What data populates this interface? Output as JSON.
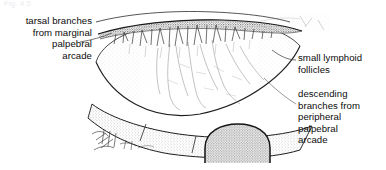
{
  "figure": {
    "title_partial": "Fig. 4.5",
    "background_color": "#ffffff",
    "ink_color": "#1a1a1a"
  },
  "labels": {
    "tarsal": {
      "text": "tarsal branches\nfrom marginal\npalpebral\narcade",
      "align": "right",
      "leader": "points to upper marginal arcade"
    },
    "follicles": {
      "text": "small lymphoid\nfollicles",
      "align": "left",
      "leader": "points to mid-superior conjunctival surface"
    },
    "descending": {
      "text": "descending\nbranches from\nperipheral\npalpebral\narcade",
      "align": "left",
      "leader": "points to descending vessels on conjunctival face"
    }
  },
  "drawing_parts": [
    {
      "name": "upper-thin-arc",
      "description": "thin curved line above lid margin"
    },
    {
      "name": "marginal-palpebral-arcade",
      "description": "dark band along lid margin with short descending tarsal branches"
    },
    {
      "name": "conjunctival-surface",
      "description": "large stippled lens-shaped tarsal conjunctiva"
    },
    {
      "name": "descending-vessel-branches",
      "description": "faint vertical vascular branches over the conjunctiva"
    },
    {
      "name": "lid-margin-band",
      "description": "lower stippled band representing the everted lid margin"
    },
    {
      "name": "follicle-dome",
      "description": "stippled dome with dark outline at lower centre"
    },
    {
      "name": "eyelash-sketch",
      "description": "sketchy eyelash strokes at lower left"
    },
    {
      "name": "corner-stipple",
      "description": "stippled fragment at upper right"
    }
  ]
}
